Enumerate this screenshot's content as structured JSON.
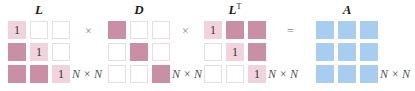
{
  "diagram": {
    "matrices": [
      {
        "name": "L",
        "label": "L",
        "superscript": "",
        "dimension": "N × N",
        "cells": [
          [
            {
              "type": "light",
              "text": "1"
            },
            {
              "type": "empty",
              "text": ""
            },
            {
              "type": "empty",
              "text": ""
            }
          ],
          [
            {
              "type": "dark",
              "text": ""
            },
            {
              "type": "light",
              "text": "1"
            },
            {
              "type": "empty",
              "text": ""
            }
          ],
          [
            {
              "type": "dark",
              "text": ""
            },
            {
              "type": "dark",
              "text": ""
            },
            {
              "type": "light",
              "text": "1"
            }
          ]
        ]
      },
      {
        "name": "D",
        "label": "D",
        "superscript": "",
        "dimension": "N × N",
        "cells": [
          [
            {
              "type": "dark",
              "text": ""
            },
            {
              "type": "empty",
              "text": ""
            },
            {
              "type": "empty",
              "text": ""
            }
          ],
          [
            {
              "type": "empty",
              "text": ""
            },
            {
              "type": "dark",
              "text": ""
            },
            {
              "type": "empty",
              "text": ""
            }
          ],
          [
            {
              "type": "empty",
              "text": ""
            },
            {
              "type": "empty",
              "text": ""
            },
            {
              "type": "dark",
              "text": ""
            }
          ]
        ]
      },
      {
        "name": "L-transpose",
        "label": "L",
        "superscript": "T",
        "dimension": "N × N",
        "cells": [
          [
            {
              "type": "light",
              "text": "1"
            },
            {
              "type": "dark",
              "text": ""
            },
            {
              "type": "dark",
              "text": ""
            }
          ],
          [
            {
              "type": "empty",
              "text": ""
            },
            {
              "type": "light",
              "text": "1"
            },
            {
              "type": "dark",
              "text": ""
            }
          ],
          [
            {
              "type": "empty",
              "text": ""
            },
            {
              "type": "empty",
              "text": ""
            },
            {
              "type": "light",
              "text": "1"
            }
          ]
        ]
      },
      {
        "name": "A",
        "label": "A",
        "superscript": "",
        "dimension": "N × N",
        "cells": [
          [
            {
              "type": "blue",
              "text": ""
            },
            {
              "type": "blue",
              "text": ""
            },
            {
              "type": "blue",
              "text": ""
            }
          ],
          [
            {
              "type": "blue",
              "text": ""
            },
            {
              "type": "blue",
              "text": ""
            },
            {
              "type": "blue",
              "text": ""
            }
          ],
          [
            {
              "type": "blue",
              "text": ""
            },
            {
              "type": "blue",
              "text": ""
            },
            {
              "type": "blue",
              "text": ""
            }
          ]
        ]
      }
    ],
    "operators": [
      "×",
      "×",
      "="
    ],
    "colors": {
      "dark_pink": "#c98fa5",
      "light_pink": "#f1d3dd",
      "blue": "#a8cdef",
      "empty_border": "#e8dde2"
    }
  }
}
